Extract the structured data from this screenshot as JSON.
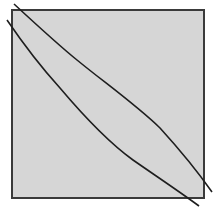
{
  "diagram": {
    "colors": {
      "background": "#ffffff",
      "square_fill": "#d6d6d6",
      "square_border": "#3a3a3a",
      "curve_stroke": "#1e1e1e"
    },
    "square": {
      "x": 12,
      "y": 10,
      "width": 192,
      "height": 188
    },
    "curves": [
      {
        "name": "upper-curve",
        "points": [
          [
            14,
            4
          ],
          [
            77,
            60
          ],
          [
            160,
            128
          ],
          [
            212,
            192
          ]
        ]
      },
      {
        "name": "lower-curve",
        "points": [
          [
            7,
            20
          ],
          [
            60,
            88
          ],
          [
            133,
            160
          ],
          [
            199,
            206
          ]
        ]
      }
    ]
  }
}
